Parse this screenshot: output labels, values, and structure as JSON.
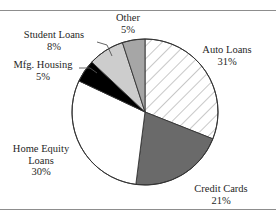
{
  "chart_data": {
    "type": "pie",
    "title": "",
    "subtitle": "",
    "xlabel": "",
    "ylabel": "",
    "legend_position": "none",
    "grid": false,
    "labels_on_slices": false,
    "start_angle_deg": 0,
    "direction": "clockwise",
    "categories": [
      "Auto Loans",
      "Credit Cards",
      "Home Equity Loans",
      "Mfg. Housing",
      "Student Loans",
      "Other"
    ],
    "values": [
      31,
      21,
      30,
      5,
      8,
      5
    ],
    "units": "percent",
    "slices": [
      {
        "name": "Auto Loans",
        "label": "Auto Loans",
        "value": 31,
        "value_text": "31%",
        "fill": "diagonal-hatch",
        "color": "#ffffff",
        "hatch_color": "#9a9a9a",
        "label_position": "right",
        "leader_line": false
      },
      {
        "name": "Credit Cards",
        "label": "Credit Cards",
        "value": 21,
        "value_text": "21%",
        "fill": "solid",
        "color": "#6a6a6a",
        "hatch_color": "",
        "label_position": "bottom-right",
        "leader_line": false
      },
      {
        "name": "Home Equity Loans",
        "label": "Home Equity",
        "label_line2": "Loans",
        "value": 30,
        "value_text": "30%",
        "fill": "solid",
        "color": "#ffffff",
        "hatch_color": "",
        "label_position": "left",
        "leader_line": false
      },
      {
        "name": "Mfg. Housing",
        "label": "Mfg. Housing",
        "value": 5,
        "value_text": "5%",
        "fill": "solid",
        "color": "#000000",
        "hatch_color": "",
        "label_position": "upper-left",
        "leader_line": true
      },
      {
        "name": "Student Loans",
        "label": "Student Loans",
        "value": 8,
        "value_text": "8%",
        "fill": "solid",
        "color": "#cdcdcd",
        "hatch_color": "",
        "label_position": "upper-left",
        "leader_line": true
      },
      {
        "name": "Other",
        "label": "Other",
        "value": 5,
        "value_text": "5%",
        "fill": "solid",
        "color": "#a6a6a6",
        "hatch_color": "",
        "label_position": "top",
        "leader_line": false
      }
    ],
    "outline_color": "#333333",
    "background_color": "#ffffff",
    "rule_color": "#8d8d8d"
  },
  "labels": {
    "other": {
      "name": "Other",
      "pct": "5%"
    },
    "student_loans": {
      "name": "Student Loans",
      "pct": "8%"
    },
    "mfg_housing": {
      "name": "Mfg. Housing",
      "pct": "5%"
    },
    "home_equity": {
      "line1": "Home Equity",
      "line2": "Loans",
      "pct": "30%"
    },
    "auto_loans": {
      "name": "Auto Loans",
      "pct": "31%"
    },
    "credit_cards": {
      "name": "Credit Cards",
      "pct": "21%"
    }
  }
}
